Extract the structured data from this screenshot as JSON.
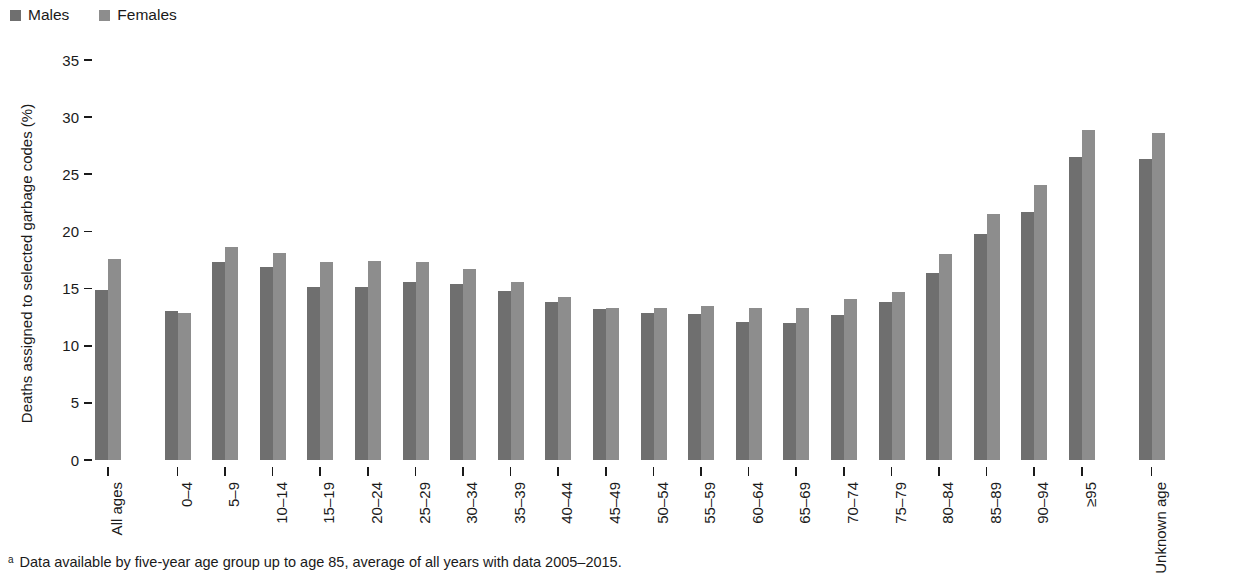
{
  "legend": {
    "items": [
      {
        "label": "Males",
        "color": "#6f6f6f",
        "key": "males"
      },
      {
        "label": "Females",
        "color": "#8d8d8d",
        "key": "females"
      }
    ]
  },
  "footnote": {
    "marker": "a",
    "text": "Data available by five-year age group up to age 85, average of all years with data 2005–2015."
  },
  "chart_data": {
    "type": "bar",
    "title": "",
    "xlabel": "",
    "ylabel": "Deaths assigned to selected garbage codes (%)",
    "ylim": [
      0,
      35
    ],
    "yticks": [
      0,
      5,
      10,
      15,
      20,
      25,
      30,
      35
    ],
    "ytick_labels": [
      "0",
      "5",
      "10",
      "15",
      "20",
      "25",
      "30",
      "35"
    ],
    "grid": false,
    "legend_position": "top-left",
    "categories": [
      "All ages",
      "0–4",
      "5–9",
      "10–14",
      "15–19",
      "20–24",
      "25–29",
      "30–34",
      "35–39",
      "40–44",
      "45–49",
      "50–54",
      "55–59",
      "60–64",
      "65–69",
      "70–74",
      "75–79",
      "80–84",
      "85–89",
      "90–94",
      "≥95",
      "Unknown age"
    ],
    "gaps_after": [
      "All ages",
      "≥95"
    ],
    "series": [
      {
        "name": "Males",
        "color": "#6f6f6f",
        "values": [
          14.9,
          13.0,
          17.3,
          16.9,
          15.1,
          15.1,
          15.6,
          15.4,
          14.8,
          13.8,
          13.2,
          12.9,
          12.8,
          12.1,
          12.0,
          12.7,
          13.8,
          16.4,
          19.8,
          21.7,
          26.5,
          26.3
        ]
      },
      {
        "name": "Females",
        "color": "#8d8d8d",
        "values": [
          17.6,
          12.9,
          18.6,
          18.1,
          17.3,
          17.4,
          17.3,
          16.7,
          15.6,
          14.3,
          13.3,
          13.3,
          13.5,
          13.3,
          13.3,
          14.1,
          14.7,
          18.0,
          21.5,
          24.1,
          28.9,
          28.6
        ]
      }
    ]
  }
}
